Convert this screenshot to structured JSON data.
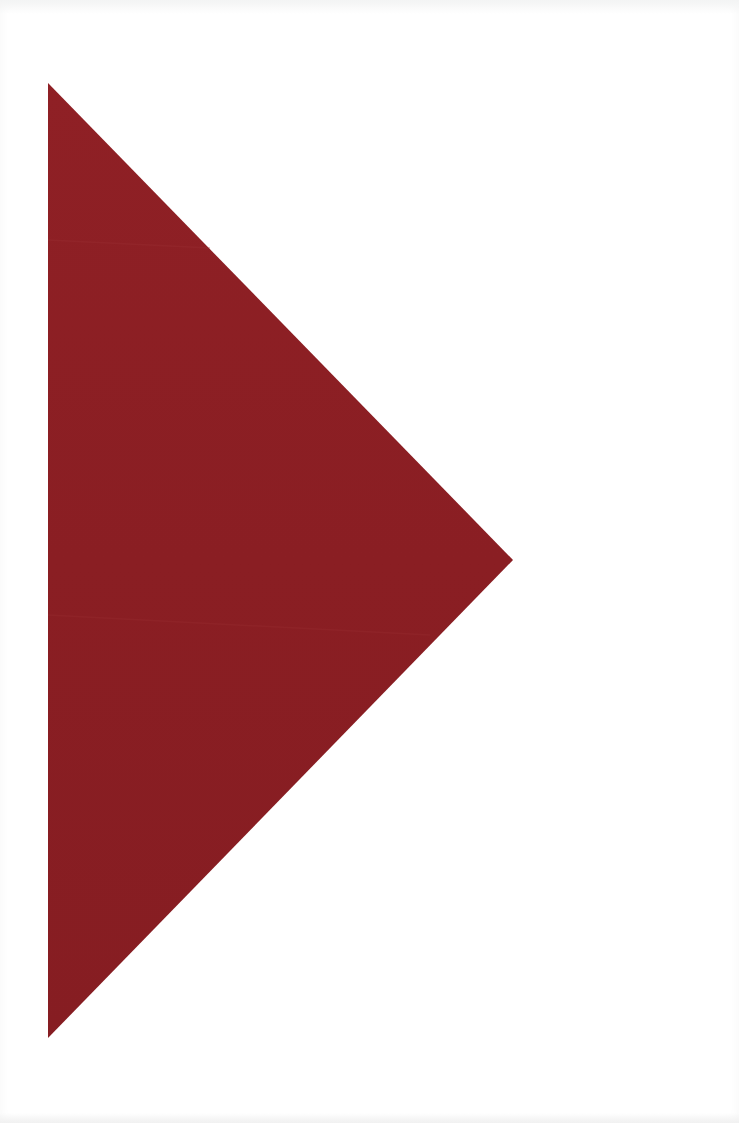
{
  "page": {
    "background": "#ffffff",
    "width": 739,
    "height": 1123
  },
  "shape": {
    "type": "triangle",
    "direction": "right",
    "fill": "#8b1e22",
    "fill_highlight": "#94252a",
    "points": [
      [
        48,
        83
      ],
      [
        513,
        560
      ],
      [
        48,
        1038
      ]
    ]
  }
}
